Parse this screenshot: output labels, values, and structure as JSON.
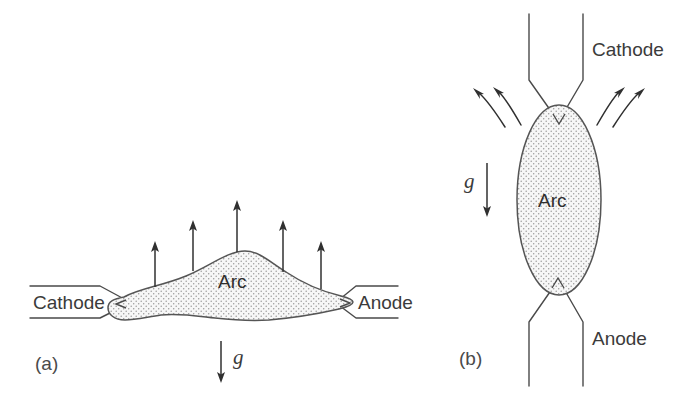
{
  "figure": {
    "background_color": "#ffffff",
    "line_color": "#4a4a4a",
    "arrow_color": "#303030",
    "stipple_color": "#8a8a8a",
    "arc_fill_color": "#f4f4f4",
    "width": 697,
    "height": 397
  },
  "panels": [
    {
      "id": "a",
      "caption": "(a)",
      "orientation": "horizontal",
      "arc_label": "Arc",
      "gravity_label": "g",
      "gravity_direction": "down",
      "buoyancy_arrow_count": 5,
      "electrodes": [
        {
          "name": "cathode",
          "label": "Cathode",
          "position": "left"
        },
        {
          "name": "anode",
          "label": "Anode",
          "position": "right"
        }
      ]
    },
    {
      "id": "b",
      "caption": "(b)",
      "orientation": "vertical",
      "arc_label": "Arc",
      "gravity_label": "g",
      "gravity_direction": "down",
      "convection_arrow_count": 4,
      "electrodes": [
        {
          "name": "cathode",
          "label": "Cathode",
          "position": "top"
        },
        {
          "name": "anode",
          "label": "Anode",
          "position": "bottom"
        }
      ]
    }
  ]
}
